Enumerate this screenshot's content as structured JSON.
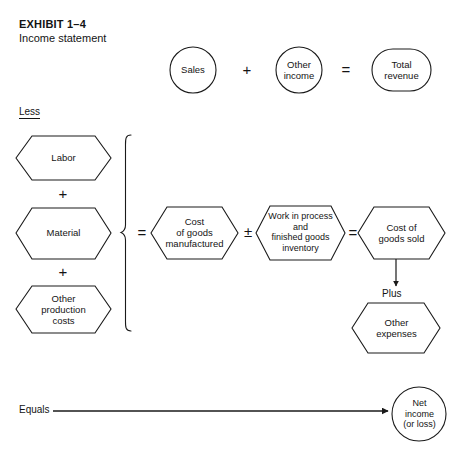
{
  "header": {
    "title": "EXHIBIT 1–4",
    "subtitle": "Income statement"
  },
  "labels": {
    "less": "Less",
    "equals": "Equals",
    "plus_word": "Plus"
  },
  "operators": {
    "plus_top": "+",
    "equals_top": "=",
    "plus_labor_material": "+",
    "plus_material_other": "+",
    "equals_brace": "=",
    "plus_minus_wip": "±",
    "equals_cogs": "="
  },
  "nodes": {
    "sales": {
      "label": "Sales",
      "shape": "circle"
    },
    "other_income": {
      "label": "Other\nincome",
      "shape": "circle"
    },
    "total_revenue": {
      "label": "Total\nrevenue",
      "shape": "stadium"
    },
    "labor": {
      "label": "Labor",
      "shape": "hexagon"
    },
    "material": {
      "label": "Material",
      "shape": "hexagon"
    },
    "other_production_costs": {
      "label": "Other\nproduction\ncosts",
      "shape": "hexagon"
    },
    "cost_of_goods_manufactured": {
      "label": "Cost\nof goods\nmanufactured",
      "shape": "hexagon"
    },
    "work_in_process": {
      "label": "Work in process\nand\nfinished goods\ninventory",
      "shape": "hexagon"
    },
    "cost_of_goods_sold": {
      "label": "Cost of\ngoods sold",
      "shape": "hexagon"
    },
    "other_expenses": {
      "label": "Other\nexpenses",
      "shape": "hexagon"
    },
    "net_income": {
      "label": "Net\nincome\n(or loss)",
      "shape": "circle"
    }
  },
  "colors": {
    "stroke": "#1a1a1a",
    "background": "#ffffff",
    "text": "#141414"
  }
}
